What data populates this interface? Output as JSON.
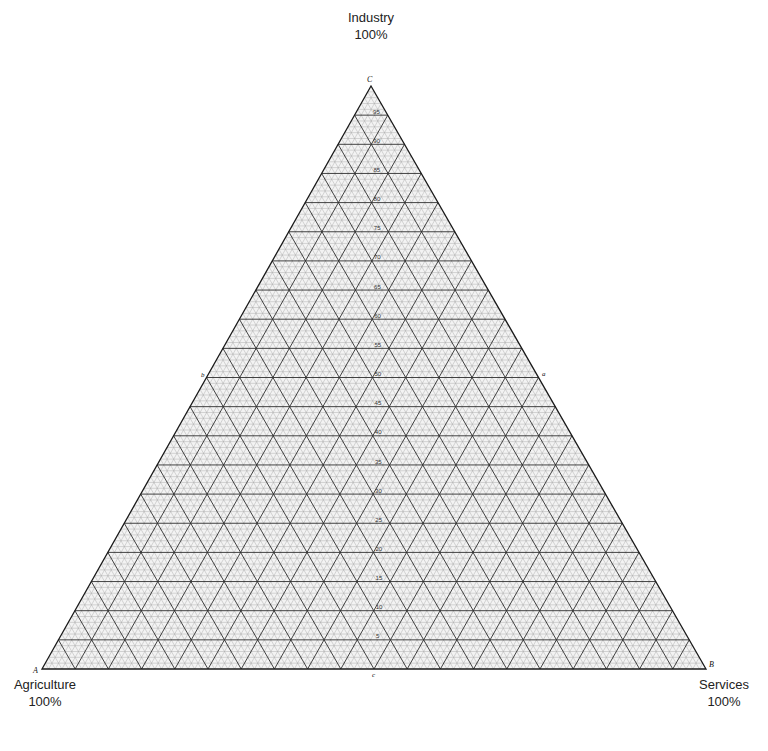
{
  "chart_data": {
    "type": "ternary",
    "title": "",
    "vertices": [
      {
        "id": "A",
        "name": "Agriculture",
        "value_label": "100%",
        "position": "bottom-left"
      },
      {
        "id": "B",
        "name": "Services",
        "value_label": "100%",
        "position": "bottom-right"
      },
      {
        "id": "C",
        "name": "Industry",
        "value_label": "100%",
        "position": "top"
      }
    ],
    "median_labels": [
      {
        "id": "a",
        "side": "BC (right side midpoint)"
      },
      {
        "id": "b",
        "side": "AC (left side midpoint)"
      },
      {
        "id": "c",
        "side": "AB (base midpoint)"
      }
    ],
    "major_grid_step_percent": 5,
    "minor_grid_step_percent": 1,
    "center_axis_ticks": [
      5,
      10,
      15,
      20,
      25,
      30,
      35,
      40,
      45,
      50,
      55,
      60,
      65,
      70,
      75,
      80,
      85,
      90,
      95
    ],
    "grid": true,
    "legend": null,
    "data_points": []
  },
  "labels": {
    "top_name": "Industry",
    "top_pct": "100%",
    "left_name": "Agriculture",
    "left_pct": "100%",
    "right_name": "Services",
    "right_pct": "100%",
    "vertex_a": "A",
    "vertex_b": "B",
    "vertex_c": "C",
    "median_a": "a",
    "median_b": "b",
    "median_c": "c"
  },
  "colors": {
    "major_line": "#2b2b2b",
    "minor_line": "#9a9a9a",
    "background": "#ffffff",
    "fill": "#f4f4f4"
  }
}
